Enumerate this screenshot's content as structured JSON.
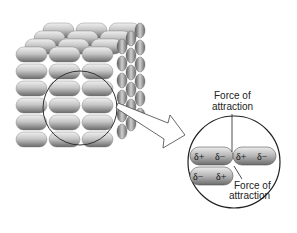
{
  "diagram": {
    "labels": {
      "force_top_line1": "Force of",
      "force_top_line2": "attraction",
      "force_bottom_line1": "Force of",
      "force_bottom_line2": "attraction"
    },
    "molecules": [
      {
        "left": "δ+",
        "right": "δ−"
      },
      {
        "left": "δ+",
        "right": "δ−"
      },
      {
        "left": "δ−",
        "right": "δ+"
      }
    ],
    "lattice": {
      "rows": 6,
      "columns": 3,
      "depth": 4
    },
    "colors": {
      "molecule": "#a8a8a8",
      "molecule_highlight": "#e6e6e6",
      "outline": "#333333",
      "background": "#ffffff"
    }
  }
}
